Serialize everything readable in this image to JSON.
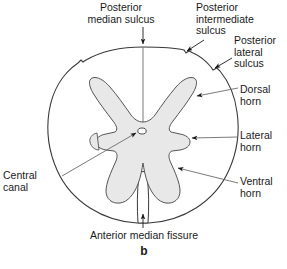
{
  "figure": {
    "panel_label": "b",
    "colors": {
      "outline": "#3a3a3a",
      "gray_matter_fill": "#e8e8e8",
      "gray_matter_stroke": "#555555",
      "leader_line": "#6b6b6b",
      "text": "#1a1a1a",
      "background": "#ffffff"
    }
  },
  "labels": {
    "posterior_median_sulcus": "Posterior\nmedian sulcus",
    "posterior_intermediate_sulcus": "Posterior\nintermediate\nsulcus",
    "posterior_lateral_sulcus": "Posterior\nlateral\nsulcus",
    "dorsal_horn": "Dorsal\nhorn",
    "lateral_horn": "Lateral\nhorn",
    "ventral_horn": "Ventral\nhorn",
    "central_canal": "Central\ncanal",
    "anterior_median_fissure": "Anterior median fissure"
  },
  "annotations": [
    {
      "name": "posterior-median-sulcus",
      "marker": "arrow-down",
      "target": "top-midline-of-cord"
    },
    {
      "name": "posterior-intermediate-sulcus",
      "marker": "arrow",
      "target": "upper-right-notch"
    },
    {
      "name": "posterior-lateral-sulcus",
      "marker": "arrow",
      "target": "right-upper-notch"
    },
    {
      "name": "dorsal-horn",
      "marker": "arrow",
      "target": "right-posterior-gray-horn"
    },
    {
      "name": "lateral-horn",
      "marker": "arrow",
      "target": "right-lateral-gray-projection"
    },
    {
      "name": "ventral-horn",
      "marker": "arrow",
      "target": "right-anterior-gray-horn"
    },
    {
      "name": "central-canal",
      "marker": "arrow",
      "target": "central-oval-opening"
    },
    {
      "name": "anterior-median-fissure",
      "marker": "arrow-up",
      "target": "bottom-midline-cleft"
    }
  ]
}
